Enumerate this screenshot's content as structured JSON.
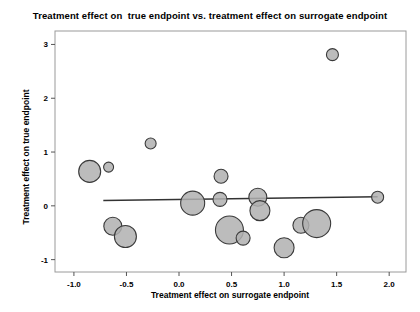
{
  "chart_data": {
    "type": "scatter",
    "title": "Treatment effect on  true endpoint vs. treatment effect on surrogate endpoint",
    "xlabel": "Treatment effect on surrogate endpoint",
    "ylabel": "Treatment effect on true endpoint",
    "xlim": [
      -1.18,
      2.16
    ],
    "ylim": [
      -1.23,
      3.25
    ],
    "xticks": [
      "-1.0",
      "-0.5",
      "0.0",
      "0.5",
      "1.0",
      "1.5",
      "2.0"
    ],
    "xtick_values": [
      -1.0,
      -0.5,
      0.0,
      0.5,
      1.0,
      1.5,
      2.0
    ],
    "yticks": [
      "-1",
      "0",
      "1",
      "2",
      "3"
    ],
    "ytick_values": [
      -1,
      0,
      1,
      2,
      3
    ],
    "grid": false,
    "legend": null,
    "marker_style": "bubble",
    "marker_fill": "#b0b0b0",
    "marker_stroke": "#3a3a3a",
    "points": [
      {
        "x": -0.85,
        "y": 0.64,
        "size": 11.0
      },
      {
        "x": -0.67,
        "y": 0.72,
        "size": 5.0
      },
      {
        "x": -0.63,
        "y": -0.38,
        "size": 9.0
      },
      {
        "x": -0.51,
        "y": -0.57,
        "size": 11.0
      },
      {
        "x": -0.27,
        "y": 1.16,
        "size": 5.5
      },
      {
        "x": 0.13,
        "y": 0.05,
        "size": 12.0
      },
      {
        "x": 0.39,
        "y": 0.12,
        "size": 7.0
      },
      {
        "x": 0.4,
        "y": 0.55,
        "size": 7.0
      },
      {
        "x": 0.48,
        "y": -0.45,
        "size": 14.0
      },
      {
        "x": 0.61,
        "y": -0.6,
        "size": 7.0
      },
      {
        "x": 0.75,
        "y": 0.16,
        "size": 9.0
      },
      {
        "x": 0.77,
        "y": -0.09,
        "size": 10.0
      },
      {
        "x": 1.0,
        "y": -0.78,
        "size": 10.0
      },
      {
        "x": 1.16,
        "y": -0.36,
        "size": 8.0
      },
      {
        "x": 1.31,
        "y": -0.33,
        "size": 14.0
      },
      {
        "x": 1.46,
        "y": 2.81,
        "size": 6.0
      },
      {
        "x": 1.89,
        "y": 0.16,
        "size": 6.0
      }
    ],
    "regression_line": {
      "x_start": -0.72,
      "y_start": 0.1,
      "x_end": 1.89,
      "y_end": 0.17,
      "color": "#333333"
    },
    "plot_bg": "#ffffff",
    "frame_color": "#9a9a9a"
  }
}
